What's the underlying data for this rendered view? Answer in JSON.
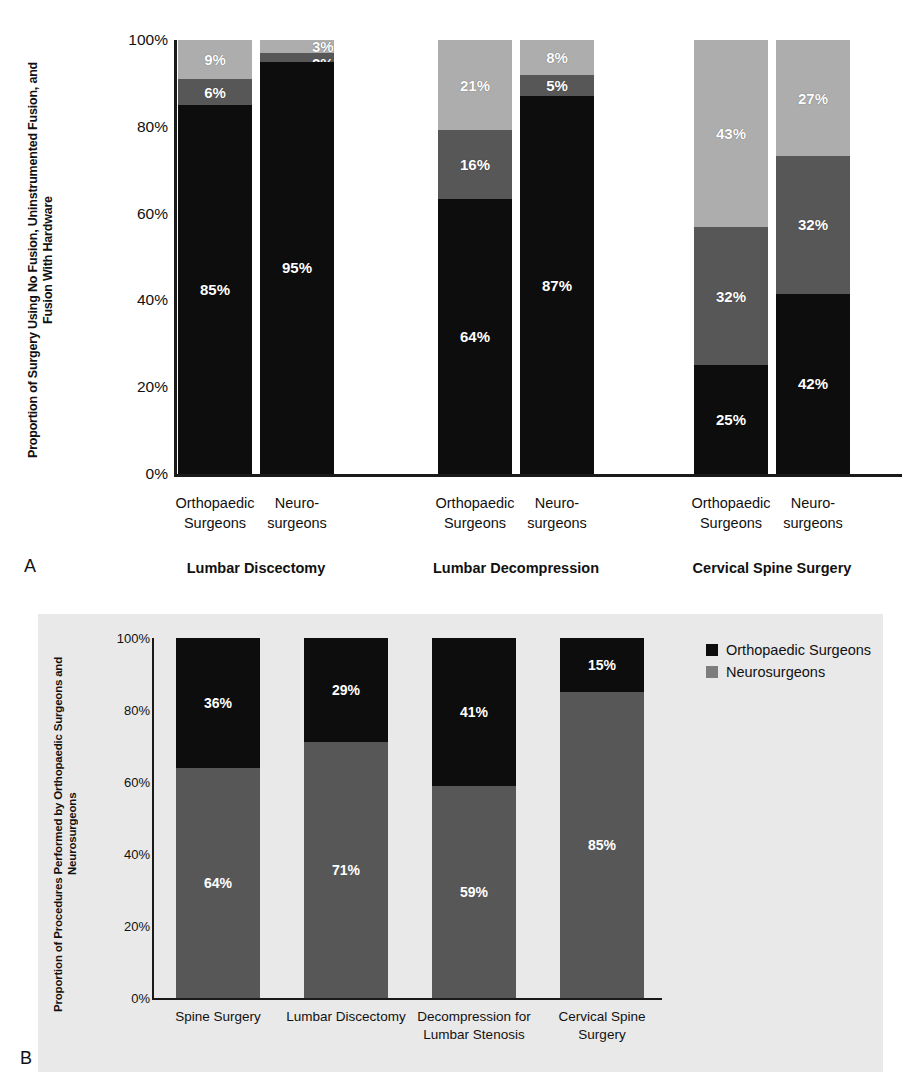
{
  "figure": {
    "panel_a_letter": "A",
    "panel_b_letter": "B"
  },
  "chart_data": [
    {
      "id": "panel-a",
      "type": "bar",
      "subtype": "stacked-100-percent",
      "title": "",
      "ylabel": "Proportion of Surgery Using No Fusion, Uninstrumented Fusion, and Fusion With Hardware",
      "xlabel": "",
      "ylim": [
        0,
        100
      ],
      "yticks": [
        "0%",
        "20%",
        "40%",
        "60%",
        "80%",
        "100%"
      ],
      "ytick_values": [
        0,
        20,
        40,
        60,
        80,
        100
      ],
      "grid": false,
      "legend": null,
      "series": [
        {
          "name": "No Fusion",
          "color": "#0d0d0d"
        },
        {
          "name": "Uninstrumented Fusion",
          "color": "#575757"
        },
        {
          "name": "Fusion With Hardware",
          "color": "#adadad"
        }
      ],
      "groups": [
        {
          "label": "Lumbar Discectomy",
          "bars": [
            {
              "label_line1": "Orthopaedic",
              "label_line2": "Surgeons",
              "segments": [
                {
                  "series": "No Fusion",
                  "value": 85,
                  "text": "85%"
                },
                {
                  "series": "Uninstrumented Fusion",
                  "value": 6,
                  "text": "6%"
                },
                {
                  "series": "Fusion With Hardware",
                  "value": 9,
                  "text": "9%"
                }
              ]
            },
            {
              "label_line1": "Neuro-",
              "label_line2": "surgeons",
              "segments": [
                {
                  "series": "No Fusion",
                  "value": 95,
                  "text": "95%"
                },
                {
                  "series": "Uninstrumented Fusion",
                  "value": 2,
                  "text": "2%"
                },
                {
                  "series": "Fusion With Hardware",
                  "value": 3,
                  "text": "3%"
                }
              ]
            }
          ]
        },
        {
          "label": "Lumbar Decompression",
          "bars": [
            {
              "label_line1": "Orthopaedic",
              "label_line2": "Surgeons",
              "segments": [
                {
                  "series": "No Fusion",
                  "value": 64,
                  "text": "64%"
                },
                {
                  "series": "Uninstrumented Fusion",
                  "value": 16,
                  "text": "16%"
                },
                {
                  "series": "Fusion With Hardware",
                  "value": 21,
                  "text": "21%"
                }
              ]
            },
            {
              "label_line1": "Neuro-",
              "label_line2": "surgeons",
              "segments": [
                {
                  "series": "No Fusion",
                  "value": 87,
                  "text": "87%"
                },
                {
                  "series": "Uninstrumented Fusion",
                  "value": 5,
                  "text": "5%"
                },
                {
                  "series": "Fusion With Hardware",
                  "value": 8,
                  "text": "8%"
                }
              ]
            }
          ]
        },
        {
          "label": "Cervical Spine Surgery",
          "bars": [
            {
              "label_line1": "Orthopaedic",
              "label_line2": "Surgeons",
              "segments": [
                {
                  "series": "No Fusion",
                  "value": 25,
                  "text": "25%"
                },
                {
                  "series": "Uninstrumented Fusion",
                  "value": 32,
                  "text": "32%"
                },
                {
                  "series": "Fusion With Hardware",
                  "value": 43,
                  "text": "43%"
                }
              ]
            },
            {
              "label_line1": "Neuro-",
              "label_line2": "surgeons",
              "segments": [
                {
                  "series": "No Fusion",
                  "value": 42,
                  "text": "42%"
                },
                {
                  "series": "Uninstrumented Fusion",
                  "value": 32,
                  "text": "32%"
                },
                {
                  "series": "Fusion With Hardware",
                  "value": 27,
                  "text": "27%"
                }
              ]
            }
          ]
        }
      ]
    },
    {
      "id": "panel-b",
      "type": "bar",
      "subtype": "stacked-100-percent",
      "title": "",
      "ylabel": "Proportion of Procedures Performed by Orthopaedic Surgeons and Neurosurgeons",
      "xlabel": "",
      "ylim": [
        0,
        100
      ],
      "yticks": [
        "0%",
        "20%",
        "40%",
        "60%",
        "80%",
        "100%"
      ],
      "ytick_values": [
        0,
        20,
        40,
        60,
        80,
        100
      ],
      "grid": false,
      "legend_position": "right",
      "legend": [
        {
          "label": "Orthopaedic Surgeons",
          "color": "#0d0d0d"
        },
        {
          "label": "Neurosurgeons",
          "color": "#7d7d7d"
        }
      ],
      "categories": [
        {
          "line1": "Spine Surgery",
          "line2": ""
        },
        {
          "line1": "Lumbar Discectomy",
          "line2": ""
        },
        {
          "line1": "Decompression for",
          "line2": "Lumbar Stenosis"
        },
        {
          "line1": "Cervical Spine",
          "line2": "Surgery"
        }
      ],
      "bars": [
        {
          "segments": [
            {
              "series": "Orthopaedic Surgeons",
              "value": 36,
              "text": "36%"
            },
            {
              "series": "Neurosurgeons",
              "value": 64,
              "text": "64%"
            }
          ]
        },
        {
          "segments": [
            {
              "series": "Orthopaedic Surgeons",
              "value": 29,
              "text": "29%"
            },
            {
              "series": "Neurosurgeons",
              "value": 71,
              "text": "71%"
            }
          ]
        },
        {
          "segments": [
            {
              "series": "Orthopaedic Surgeons",
              "value": 41,
              "text": "41%"
            },
            {
              "series": "Neurosurgeons",
              "value": 59,
              "text": "59%"
            }
          ]
        },
        {
          "segments": [
            {
              "series": "Orthopaedic Surgeons",
              "value": 15,
              "text": "15%"
            },
            {
              "series": "Neurosurgeons",
              "value": 85,
              "text": "85%"
            }
          ]
        }
      ]
    }
  ]
}
